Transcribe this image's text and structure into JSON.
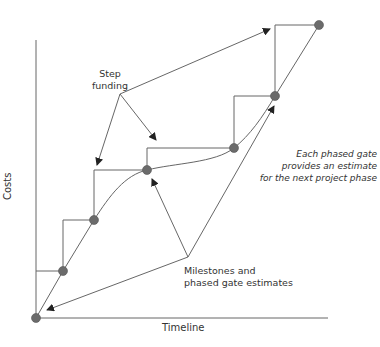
{
  "diagram": {
    "axes": {
      "y_label": "Costs",
      "x_label": "Timeline"
    },
    "annotations": {
      "step_funding": [
        "Step",
        "funding"
      ],
      "milestones": [
        "Milestones and",
        "phased gate estimates"
      ],
      "phased_gate_note": [
        "Each phased gate",
        "provides an estimate",
        "for the next project phase"
      ]
    },
    "colors": {
      "line": "#666666",
      "dot": "#6b6b6b",
      "text": "#333333"
    },
    "milestones_points": [
      [
        36,
        318
      ],
      [
        63,
        271
      ],
      [
        94,
        220
      ],
      [
        147,
        170
      ],
      [
        234,
        148
      ],
      [
        275,
        96
      ],
      [
        319,
        25
      ]
    ]
  }
}
